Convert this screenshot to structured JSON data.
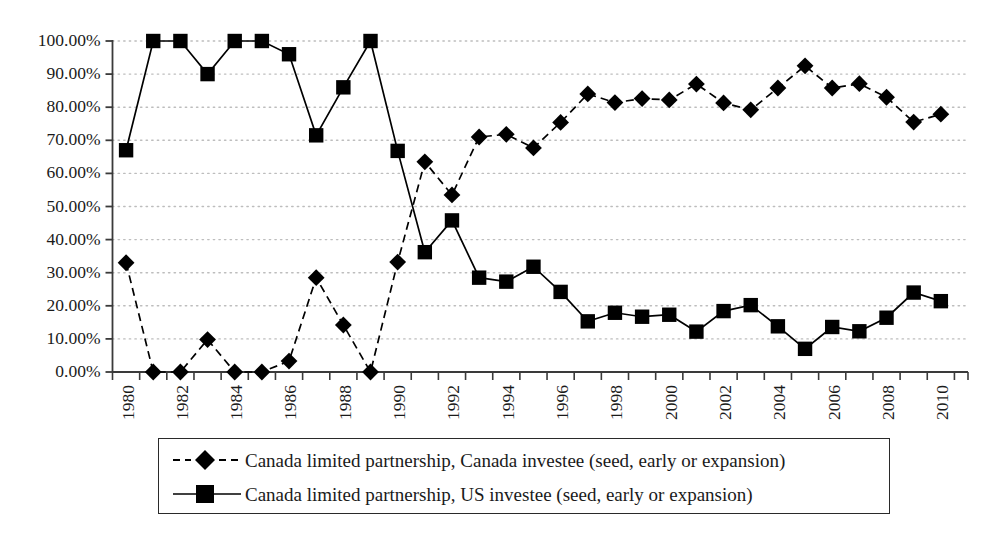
{
  "chart_data": {
    "type": "line",
    "title": "",
    "subtitle": "",
    "xlabel": "",
    "ylabel": "",
    "grid": true,
    "legend_position": "bottom",
    "xlim": [
      1980,
      2011.5
    ],
    "ylim": [
      0,
      1.0
    ],
    "y_tick_labels": [
      "100.00%",
      "90.00%",
      "80.00%",
      "70.00%",
      "60.00%",
      "50.00%",
      "40.00%",
      "30.00%",
      "20.00%",
      "10.00%",
      "0.00%"
    ],
    "y_tick_values": [
      100,
      90,
      80,
      70,
      60,
      50,
      40,
      30,
      20,
      10,
      0
    ],
    "x_tick_labels": [
      "1980",
      "1982",
      "1984",
      "1986",
      "1988",
      "1990",
      "1992",
      "1994",
      "1996",
      "1998",
      "2000",
      "2002",
      "2004",
      "2006",
      "2008",
      "2010"
    ],
    "x_tick_values": [
      1980,
      1982,
      1984,
      1986,
      1988,
      1990,
      1992,
      1994,
      1996,
      1998,
      2000,
      2002,
      2004,
      2006,
      2008,
      2010
    ],
    "x": [
      1980.5,
      1981.5,
      1982.5,
      1983.5,
      1984.5,
      1985.5,
      1986.5,
      1987.5,
      1988.5,
      1989.5,
      1990.5,
      1991.5,
      1992.5,
      1993.5,
      1994.5,
      1995.5,
      1996.5,
      1997.5,
      1998.5,
      1999.5,
      2000.5,
      2001.5,
      2002.5,
      2003.5,
      2004.5,
      2005.5,
      2006.5,
      2007.5,
      2008.5,
      2009.5,
      2010.5
    ],
    "series": [
      {
        "name": "Canada limited partnership, Canada investee (seed, early or expansion)",
        "marker": "diamond",
        "line_style": "dashed",
        "color": "#000000",
        "values": [
          33.0,
          0.0,
          0.0,
          9.8,
          0.0,
          0.0,
          3.3,
          28.5,
          14.2,
          0.0,
          33.2,
          63.5,
          53.5,
          71.0,
          71.8,
          67.7,
          75.4,
          84.0,
          81.4,
          82.6,
          82.2,
          87.0,
          81.3,
          79.2,
          85.8,
          92.5,
          85.8,
          87.1,
          83.0,
          75.5,
          77.9
        ]
      },
      {
        "name": "Canada limited partnership, US investee (seed, early or expansion)",
        "marker": "square",
        "line_style": "solid",
        "color": "#000000",
        "values": [
          67.0,
          100.0,
          100.0,
          90.0,
          100.0,
          100.0,
          96.0,
          71.5,
          86.0,
          100.0,
          66.8,
          36.2,
          45.8,
          28.5,
          27.3,
          31.8,
          24.2,
          15.3,
          17.9,
          16.7,
          17.3,
          12.2,
          18.4,
          20.2,
          13.8,
          7.0,
          13.6,
          12.3,
          16.4,
          24.0,
          21.4
        ]
      }
    ]
  },
  "legend": {
    "entries": [
      {
        "label": "Canada limited partnership, Canada investee (seed, early or expansion)",
        "marker": "diamond",
        "line_style": "dashed"
      },
      {
        "label": "Canada limited partnership, US investee (seed, early or expansion)",
        "marker": "square",
        "line_style": "solid"
      }
    ]
  },
  "colors": {
    "ink": "#1a1a1a",
    "axis": "#3a3a3a",
    "grid": "#bdbdbd",
    "marker": "#000000",
    "background": "#ffffff"
  }
}
